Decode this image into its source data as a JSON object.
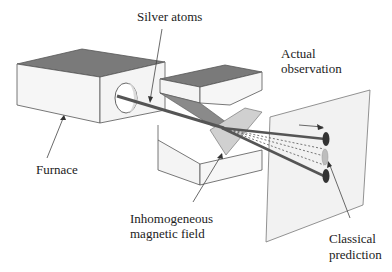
{
  "labels": {
    "silver_atoms": "Silver atoms",
    "furnace": "Furnace",
    "magnet_line1": "Inhomogeneous",
    "magnet_line2": "magnetic field",
    "actual_line1": "Actual",
    "actual_line2": "observation",
    "classical_line1": "Classical",
    "classical_line2": "prediction"
  },
  "colors": {
    "box_top": "#7a7a7a",
    "box_face": "#f4f4f4",
    "box_edge": "#555555",
    "beam": "#555555",
    "spot": "#333333",
    "classical_spot": "#bdbdbd",
    "screen": "#f2f2f2",
    "pole_face": "#d0d0d0"
  }
}
